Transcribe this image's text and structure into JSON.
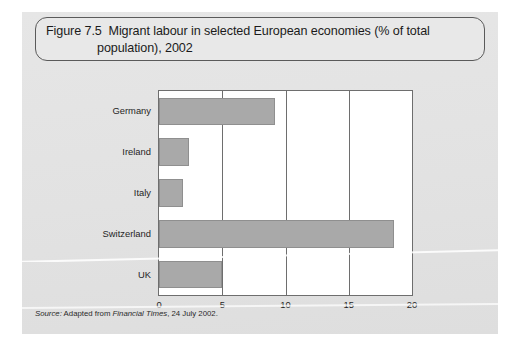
{
  "figure": {
    "number": "Figure 7.5",
    "title_line1": "Migrant labour in selected European economies (% of total",
    "title_line2": "population), 2002",
    "full_title": "Figure 7.5  Migrant labour in selected European economies (% of total population), 2002",
    "source_prefix": "Source:",
    "source_body": " Adapted from ",
    "source_publication": "Financial Times",
    "source_suffix": ", 24 July 2002.",
    "panel_background": "#e3e3e3",
    "title_border_color": "#5a5a5a"
  },
  "chart_data": {
    "type": "bar",
    "orientation": "horizontal",
    "categories": [
      "Germany",
      "Ireland",
      "Italy",
      "Switzerland",
      "UK"
    ],
    "values": [
      9.2,
      2.4,
      1.9,
      18.6,
      5.0
    ],
    "series": [
      {
        "name": "Migrant labour (% of total population)",
        "values": [
          9.2,
          2.4,
          1.9,
          18.6,
          5.0
        ]
      }
    ],
    "xlabel": "",
    "ylabel": "",
    "xlim": [
      0,
      20
    ],
    "xticks": [
      0,
      5,
      10,
      15,
      20
    ],
    "xtick_labels": [
      "0",
      "5",
      "10",
      "15",
      "20"
    ],
    "grid": true,
    "grid_axis": "x",
    "legend": false,
    "bar_color": "#a9a9a9",
    "axis_color": "#6e6e6e",
    "plot_background": "#ffffff"
  }
}
